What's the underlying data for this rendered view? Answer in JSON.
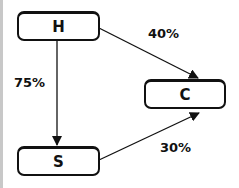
{
  "diagram": {
    "nodes": [
      {
        "id": "H",
        "label": "H"
      },
      {
        "id": "C",
        "label": "C"
      },
      {
        "id": "S",
        "label": "S"
      }
    ],
    "edges": [
      {
        "from": "H",
        "to": "C",
        "label": "40%"
      },
      {
        "from": "H",
        "to": "S",
        "label": "75%"
      },
      {
        "from": "S",
        "to": "C",
        "label": "30%"
      }
    ]
  }
}
